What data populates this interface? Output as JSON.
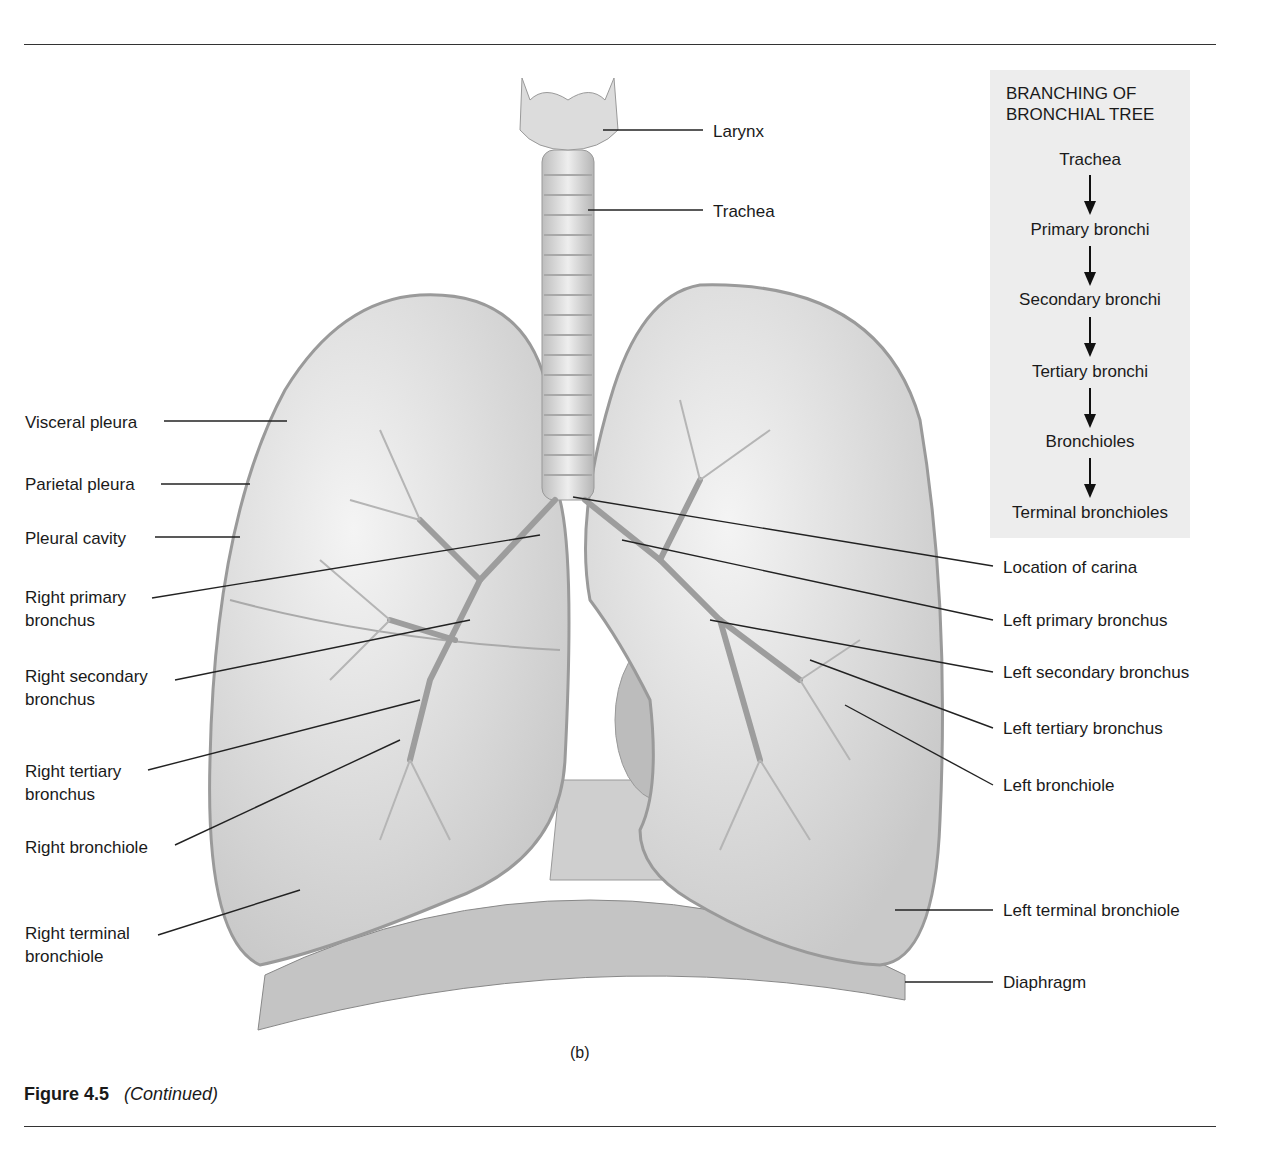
{
  "flow_box": {
    "title_line1": "BRANCHING OF",
    "title_line2": "BRONCHIAL TREE",
    "steps": [
      "Trachea",
      "Primary bronchi",
      "Secondary bronchi",
      "Tertiary bronchi",
      "Bronchioles",
      "Terminal bronchioles"
    ]
  },
  "labels": {
    "larynx": "Larynx",
    "trachea": "Trachea",
    "visceral_pleura": "Visceral pleura",
    "parietal_pleura": "Parietal pleura",
    "pleural_cavity": "Pleural cavity",
    "right_primary_1": "Right primary",
    "right_primary_2": "bronchus",
    "right_secondary_1": "Right secondary",
    "right_secondary_2": "bronchus",
    "right_tertiary_1": "Right tertiary",
    "right_tertiary_2": "bronchus",
    "right_bronchiole": "Right bronchiole",
    "right_terminal_1": "Right terminal",
    "right_terminal_2": "bronchiole",
    "carina": "Location of carina",
    "left_primary": "Left primary bronchus",
    "left_secondary": "Left secondary bronchus",
    "left_tertiary": "Left tertiary bronchus",
    "left_bronchiole": "Left bronchiole",
    "left_terminal": "Left terminal bronchiole",
    "diaphragm": "Diaphragm"
  },
  "panel_label": "(b)",
  "caption": {
    "number": "Figure 4.5",
    "text": "(Continued)"
  }
}
